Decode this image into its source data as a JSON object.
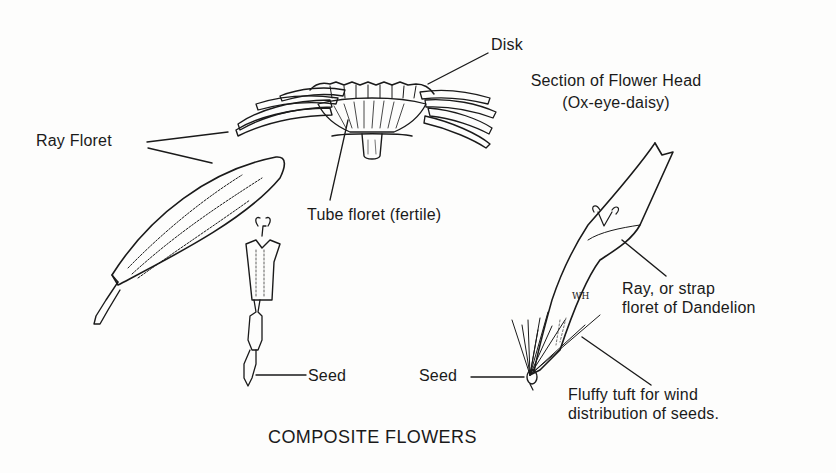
{
  "diagram": {
    "title": "COMPOSITE FLOWERS",
    "colors": {
      "ink": "#1a1a1a",
      "paper": "#fdfdfc"
    },
    "section": {
      "heading_line1": "Section of Flower Head",
      "heading_line2": "(Ox-eye-daisy)"
    },
    "labels": {
      "disk": "Disk",
      "ray_floret": "Ray Floret",
      "tube_floret": "Tube floret (fertile)",
      "seed_left": "Seed",
      "seed_right": "Seed",
      "dandelion_line1": "Ray, or strap",
      "dandelion_line2": "floret of Dandelion",
      "tuft_line1": "Fluffy tuft for wind",
      "tuft_line2": "distribution of seeds."
    },
    "artist_signature": "WH"
  }
}
